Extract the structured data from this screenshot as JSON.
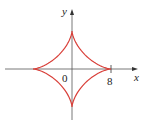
{
  "chart_data": {
    "type": "line",
    "title": "",
    "xlabel": "x",
    "ylabel": "y",
    "origin_label": "0",
    "x_tick_labels": [
      "8"
    ],
    "curve": "astroid x^(2/3) + y^(2/3) = 8^(2/3)",
    "series": [
      {
        "name": "astroid",
        "a": 8,
        "color": "#d9403a"
      }
    ],
    "xlim": [
      -11,
      11
    ],
    "ylim": [
      -9.5,
      10
    ],
    "grid": false
  }
}
